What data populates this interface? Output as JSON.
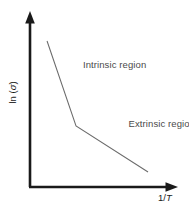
{
  "figure": {
    "background_color": "#ffffff",
    "width": 189,
    "height": 209
  },
  "axes": {
    "color": "#1a1a1a",
    "y_title_prefix": "ln (",
    "y_title_symbol": "σ",
    "y_title_suffix": ")",
    "y_title_full": "ln (σ)",
    "x_title_prefix": "1/",
    "x_title_symbol": "T",
    "x_title_full": "1/T",
    "y_axis_name": "y-axis",
    "x_axis_name": "x-axis"
  },
  "annotations": {
    "intrinsic": "Intrinsic region",
    "extrinsic": "Extrinsic region",
    "color": "#4a4a4a"
  },
  "chart_data": {
    "type": "line",
    "title": "",
    "subtitle": "",
    "xlabel": "1/T",
    "ylabel": "ln (σ)",
    "grid": false,
    "legend": false,
    "legend_position": "none",
    "axis_arrows": true,
    "tick_labels_x": [],
    "tick_labels_y": [],
    "xlim": [
      0,
      1
    ],
    "ylim": [
      0,
      1
    ],
    "series": [
      {
        "name": "ln(sigma) vs 1/T",
        "color": "#6b6b6b",
        "line_width": 1.05,
        "x": [
          0.116,
          0.313,
          0.803
        ],
        "y": [
          0.839,
          0.351,
          0.086
        ],
        "segments": [
          {
            "name": "Intrinsic region",
            "description": "steep negative slope at low 1/T (high temperature)",
            "x_start": 0.116,
            "y_start": 0.839,
            "x_end": 0.313,
            "y_end": 0.351,
            "slope": -2.477
          },
          {
            "name": "Extrinsic region",
            "description": "shallow negative slope at high 1/T (low temperature)",
            "x_start": 0.313,
            "y_start": 0.351,
            "x_end": 0.803,
            "y_end": 0.086,
            "slope": -0.541
          }
        ],
        "kink": {
          "x": 0.313,
          "y": 0.351,
          "label": "transition between intrinsic and extrinsic conduction"
        }
      }
    ],
    "annotations": [
      {
        "text": "Intrinsic region",
        "x": 0.36,
        "y": 0.7
      },
      {
        "text": "Extrinsic region",
        "x": 0.67,
        "y": 0.36
      }
    ]
  }
}
